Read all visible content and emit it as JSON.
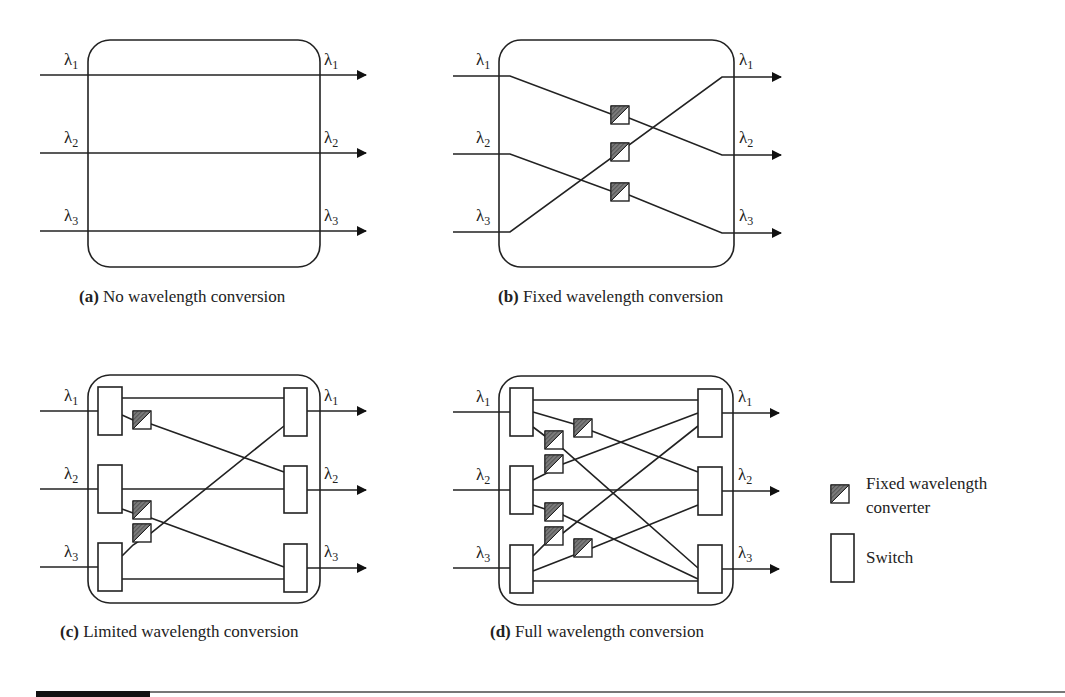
{
  "colors": {
    "stroke": "#222222",
    "converter_fill": "#6e6e6e",
    "background": "#ffffff"
  },
  "panels": [
    {
      "id": "a",
      "tag": "(a)",
      "caption": "No wavelength conversion",
      "inputs": [
        "λ1",
        "λ2",
        "λ3"
      ],
      "outputs": [
        "λ1",
        "λ2",
        "λ3"
      ],
      "components": []
    },
    {
      "id": "b",
      "tag": "(b)",
      "caption": "Fixed wavelength conversion",
      "inputs": [
        "λ1",
        "λ2",
        "λ3"
      ],
      "outputs": [
        "λ1",
        "λ2",
        "λ3"
      ],
      "components": [
        "fixed wavelength converter",
        "fixed wavelength converter",
        "fixed wavelength converter"
      ]
    },
    {
      "id": "c",
      "tag": "(c)",
      "caption": "Limited wavelength conversion",
      "inputs": [
        "λ1",
        "λ2",
        "λ3"
      ],
      "outputs": [
        "λ1",
        "λ2",
        "λ3"
      ],
      "components": [
        "switch x6",
        "fixed wavelength converter x3"
      ]
    },
    {
      "id": "d",
      "tag": "(d)",
      "caption": "Full wavelength conversion",
      "inputs": [
        "λ1",
        "λ2",
        "λ3"
      ],
      "outputs": [
        "λ1",
        "λ2",
        "λ3"
      ],
      "components": [
        "switch x6",
        "fixed wavelength converter x6"
      ]
    }
  ],
  "lambda_symbol": "λ",
  "legend": {
    "converter_label_line1": "Fixed wavelength",
    "converter_label_line2": "converter",
    "switch_label": "Switch"
  }
}
